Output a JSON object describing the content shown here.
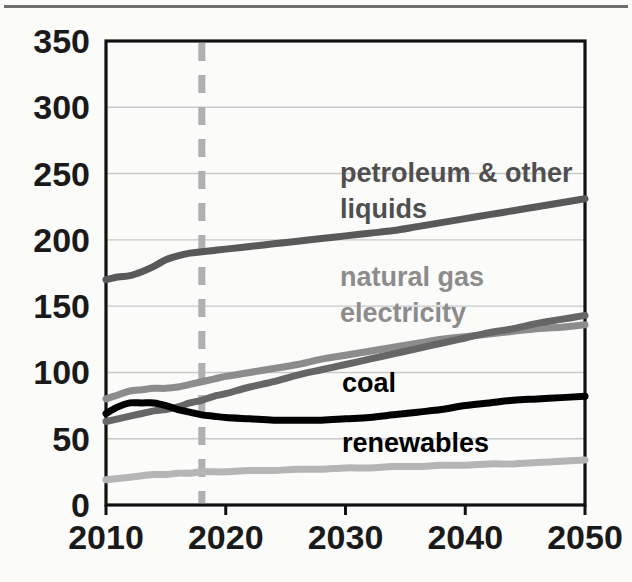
{
  "figure": {
    "top_rule_color": "#6e6e6e",
    "background": "#fbfbfa",
    "plot_border_color": "#111111",
    "gridline_color": "#c9c9c9"
  },
  "chart_data": {
    "type": "line",
    "title": "",
    "subtitle": "",
    "xlabel": "",
    "ylabel": "",
    "xlim": [
      2010,
      2050
    ],
    "ylim": [
      0,
      350
    ],
    "x_ticks": [
      2010,
      2020,
      2030,
      2040,
      2050
    ],
    "y_ticks": [
      0,
      50,
      100,
      150,
      200,
      250,
      300,
      350
    ],
    "grid": "horizontal",
    "legend_position": "inline-annotations",
    "annotations": [
      {
        "name": "projection-divider",
        "type": "vline",
        "x": 2018,
        "style": "dashed",
        "color": "#b0b0b0"
      }
    ],
    "x": [
      2010,
      2011,
      2012,
      2013,
      2014,
      2015,
      2016,
      2017,
      2018,
      2019,
      2020,
      2022,
      2024,
      2026,
      2028,
      2030,
      2032,
      2034,
      2036,
      2038,
      2040,
      2042,
      2044,
      2046,
      2048,
      2050
    ],
    "series": [
      {
        "name": "petroleum & other liquids",
        "label": "petroleum & other liquids",
        "color": "#595959",
        "label_color": "#4f4f4f",
        "label_x": 340,
        "label_y": 182,
        "values": [
          170,
          172,
          173,
          176,
          180,
          185,
          188,
          190,
          191,
          192,
          193,
          195,
          197,
          199,
          201,
          203,
          205,
          207,
          210,
          213,
          216,
          219,
          222,
          225,
          228,
          231
        ]
      },
      {
        "name": "natural gas",
        "label": "natural gas",
        "color": "#8c8c8c",
        "label_color": "#8c8c8c",
        "label_x": 340,
        "label_y": 286,
        "values": [
          80,
          83,
          86,
          87,
          88,
          88,
          89,
          91,
          93,
          95,
          97,
          100,
          103,
          106,
          110,
          113,
          116,
          119,
          122,
          125,
          127,
          129,
          131,
          133,
          134,
          136
        ]
      },
      {
        "name": "electricity",
        "label": "electricity",
        "color": "#666666",
        "label_color": "#8c8c8c",
        "label_x": 340,
        "label_y": 322,
        "values": [
          63,
          65,
          67,
          69,
          71,
          72,
          74,
          77,
          79,
          82,
          84,
          89,
          93,
          98,
          102,
          106,
          110,
          114,
          118,
          122,
          126,
          130,
          133,
          137,
          140,
          143
        ]
      },
      {
        "name": "coal",
        "label": "coal",
        "color": "#000000",
        "label_color": "#000000",
        "label_x": 342,
        "label_y": 392,
        "values": [
          69,
          74,
          77,
          77,
          77,
          75,
          72,
          70,
          68,
          67,
          66,
          65,
          64,
          64,
          64,
          65,
          66,
          68,
          70,
          72,
          75,
          77,
          79,
          80,
          81,
          82
        ]
      },
      {
        "name": "renewables",
        "label": "renewables",
        "color": "#b5b5b5",
        "label_color": "#000000",
        "label_x": 342,
        "label_y": 452,
        "values": [
          19,
          20,
          21,
          22,
          23,
          23,
          24,
          24,
          25,
          25,
          25,
          26,
          26,
          27,
          27,
          28,
          28,
          29,
          29,
          30,
          30,
          31,
          31,
          32,
          33,
          34
        ]
      }
    ]
  }
}
